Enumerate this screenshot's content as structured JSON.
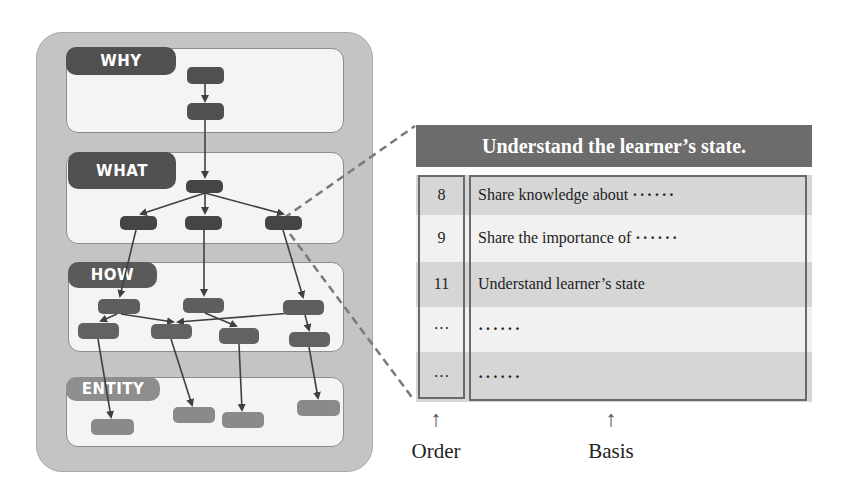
{
  "diagram": {
    "sections": [
      {
        "id": "why",
        "label": "WHY",
        "box": {
          "x": 66,
          "y": 48,
          "w": 278,
          "h": 85
        },
        "label_box": {
          "x": 66,
          "y": 47,
          "w": 110,
          "h": 28
        },
        "label_tone": "dark"
      },
      {
        "id": "what",
        "label": "WHAT",
        "box": {
          "x": 66,
          "y": 152,
          "w": 278,
          "h": 92
        },
        "label_box": {
          "x": 68,
          "y": 152,
          "w": 108,
          "h": 37
        },
        "label_tone": "dark"
      },
      {
        "id": "how",
        "label": "HOW",
        "box": {
          "x": 68,
          "y": 262,
          "w": 276,
          "h": 90
        },
        "label_box": {
          "x": 68,
          "y": 262,
          "w": 89,
          "h": 26
        },
        "label_tone": "mid"
      },
      {
        "id": "entity",
        "label": "ENTITY",
        "box": {
          "x": 66,
          "y": 377,
          "w": 278,
          "h": 70
        },
        "label_box": {
          "x": 66,
          "y": 377,
          "w": 94,
          "h": 24
        },
        "label_tone": "light"
      }
    ],
    "colors": {
      "outer_panel": "#c4c4c4",
      "section_fill": "#f4f4f4",
      "node_dark": "#505050",
      "node_mid": "#656565",
      "node_entity": "#8a8a8a",
      "edge": "#404040",
      "dashed": "#7a7a7a"
    }
  },
  "table": {
    "title": "Understand the learner’s state.",
    "rows": [
      {
        "order": "8",
        "basis": "Share knowledge about",
        "suffix": "······"
      },
      {
        "order": "9",
        "basis": "Share the importance of",
        "suffix": "······"
      },
      {
        "order": "11",
        "basis": "Understand learner’s state",
        "suffix": ""
      },
      {
        "order": "···",
        "basis": "",
        "suffix": "······"
      },
      {
        "order": "···",
        "basis": "",
        "suffix": "······"
      }
    ],
    "colors": {
      "header_bg": "#6c6c6c",
      "row_gray": "#d6d6d6",
      "row_light": "#f1f1f1",
      "border": "#6a6a6a"
    }
  },
  "captions": {
    "order": "Order",
    "basis": "Basis",
    "arrow": "↑"
  }
}
